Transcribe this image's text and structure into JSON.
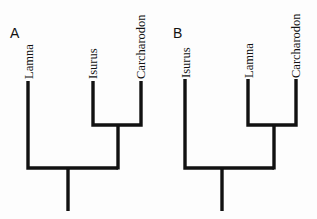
{
  "diagram": {
    "type": "cladogram-comparison",
    "panels": [
      {
        "label": "A",
        "taxa": [
          "Lamna",
          "Isurus",
          "Carcharodon"
        ],
        "topology": "(Lamna,(Isurus,Carcharodon))",
        "sister_group": [
          "Isurus",
          "Carcharodon"
        ]
      },
      {
        "label": "B",
        "taxa": [
          "Isurus",
          "Lamna",
          "Carcharodon"
        ],
        "topology": "(Isurus,(Lamna,Carcharodon))",
        "sister_group": [
          "Lamna",
          "Carcharodon"
        ]
      }
    ],
    "colors": {
      "line": "#111111",
      "background": "#fdfdfd"
    }
  }
}
